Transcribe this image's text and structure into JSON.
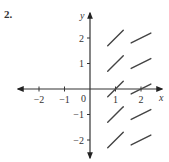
{
  "problem": {
    "number": "2."
  },
  "axes": {
    "x_label": "x",
    "y_label": "y",
    "origin_label": "0",
    "x_ticks": [
      {
        "value": -2,
        "label": "−2"
      },
      {
        "value": -1,
        "label": "−1"
      },
      {
        "value": 1,
        "label": "1"
      },
      {
        "value": 2,
        "label": "2"
      }
    ],
    "y_ticks": [
      {
        "value": 2,
        "label": "2"
      },
      {
        "value": 1,
        "label": "1"
      },
      {
        "value": -1,
        "label": "−1"
      },
      {
        "value": -2,
        "label": "−2"
      }
    ],
    "color": "#333333"
  },
  "slope_field": {
    "segments": [
      {
        "x": 1,
        "y": 2,
        "slope": 1.0
      },
      {
        "x": 2,
        "y": 2,
        "slope": 0.5
      },
      {
        "x": 1,
        "y": 1,
        "slope": 1.0
      },
      {
        "x": 2,
        "y": 1,
        "slope": 0.5
      },
      {
        "x": 1,
        "y": 0,
        "slope": 1.0
      },
      {
        "x": 2,
        "y": 0,
        "slope": 0.5
      },
      {
        "x": 1,
        "y": -1,
        "slope": 1.0
      },
      {
        "x": 2,
        "y": -1,
        "slope": 0.5
      },
      {
        "x": 1,
        "y": -2,
        "slope": 1.0
      },
      {
        "x": 2,
        "y": -2,
        "slope": 0.5
      }
    ],
    "color": "#444444"
  }
}
